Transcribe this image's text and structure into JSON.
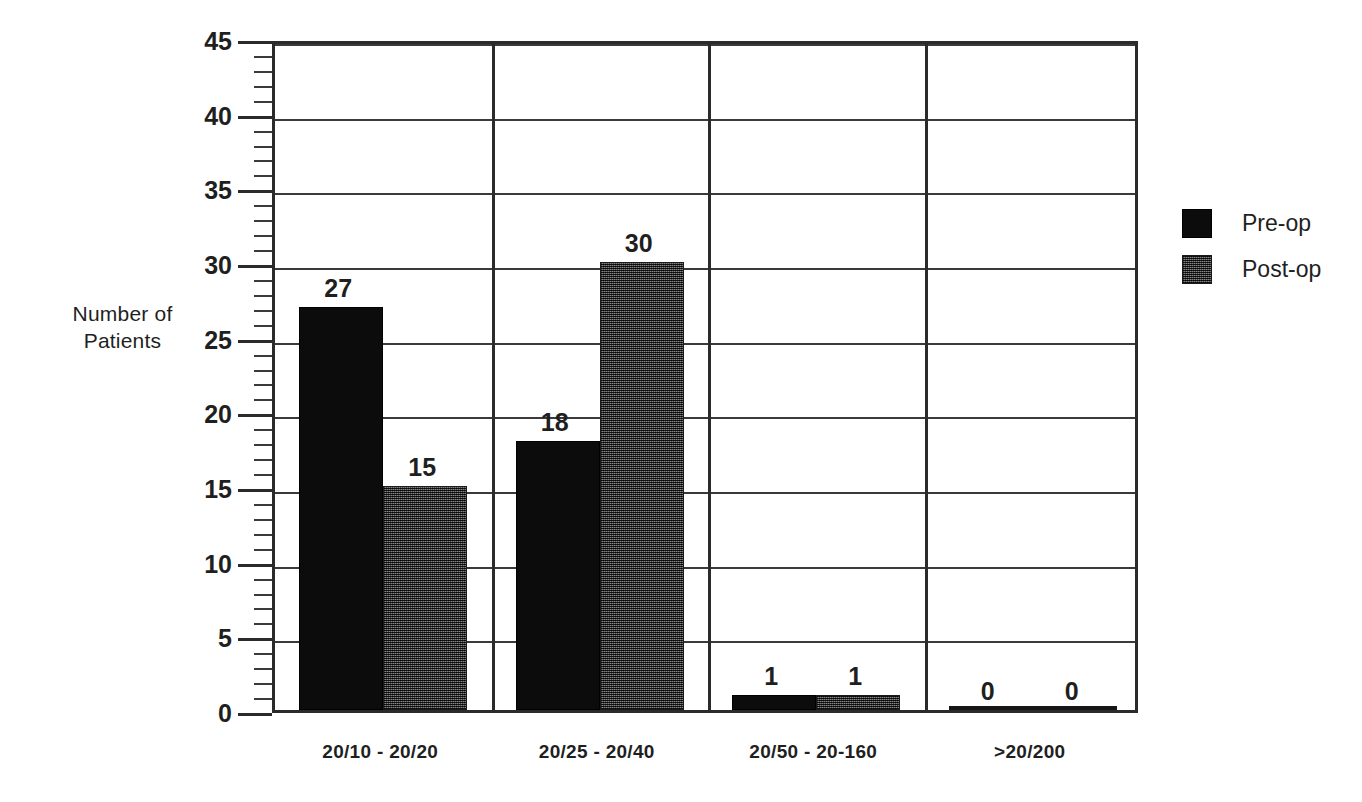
{
  "chart_data": {
    "type": "bar",
    "title": "",
    "subtitle": "",
    "xlabel": "",
    "ylabel_line1": "Number of",
    "ylabel_line2": "Patients",
    "categories": [
      "20/10 - 20/20",
      "20/25 - 20/40",
      "20/50 - 20-160",
      ">20/200"
    ],
    "series": [
      {
        "name": "Pre-op",
        "values": [
          27,
          18,
          1,
          0
        ],
        "fill": "solid-black",
        "color": "#0c0c0c"
      },
      {
        "name": "Post-op",
        "values": [
          15,
          30,
          1,
          0
        ],
        "fill": "dither-gray",
        "color": "#3c3c3c"
      }
    ],
    "ylim": [
      0,
      45
    ],
    "ytick_labels": [
      "0",
      "5",
      "10",
      "15",
      "20",
      "25",
      "30",
      "35",
      "40",
      "45"
    ],
    "ytick_values": [
      0,
      5,
      10,
      15,
      20,
      25,
      30,
      35,
      40,
      45
    ],
    "ytick_minor_step": 1,
    "grid": "horizontal-major-only",
    "group_dividers": true,
    "legend_position": "right",
    "data_labels_shown": true
  },
  "legend": {
    "items": [
      {
        "label": "Pre-op"
      },
      {
        "label": "Post-op"
      }
    ]
  },
  "colors": {
    "axis": "#2b2b2b",
    "grid": "#3a3a3a",
    "text": "#1f1f1f",
    "background": "#ffffff"
  }
}
